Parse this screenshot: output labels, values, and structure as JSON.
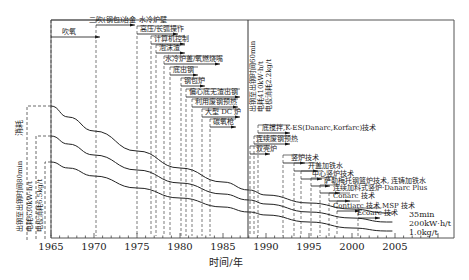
{
  "chart_data": {
    "type": "line",
    "title": "",
    "xlabel": "时间/年",
    "ylabel": "消耗",
    "xlim": [
      1965,
      2010
    ],
    "x_ticks": [
      1965,
      1970,
      1975,
      1980,
      1985,
      1990,
      1995,
      2000,
      2005
    ],
    "grid": false,
    "divider_year": 1988,
    "series": [
      {
        "name": "出钢至出钢时间",
        "start_label": "出钢至出钢时间80min",
        "mid_label": "出钢至出钢时间60min",
        "end_label": "35min",
        "x": [
          1965,
          1967,
          1970,
          1975,
          1980,
          1985,
          1988,
          1990,
          1995,
          2000,
          2004
        ],
        "y_px": [
          106,
          117,
          131,
          151,
          168,
          182,
          190,
          195,
          203,
          209,
          213
        ]
      },
      {
        "name": "电耗",
        "start_label": "电耗630kW·h/t",
        "mid_label": "电耗410kW·h/t",
        "end_label": "200kW·h/t",
        "x": [
          1965,
          1967,
          1970,
          1975,
          1980,
          1985,
          1988,
          1990,
          1995,
          2000,
          2004
        ],
        "y_px": [
          136,
          144,
          155,
          170,
          183,
          194,
          200,
          204,
          212,
          218,
          222
        ]
      },
      {
        "name": "电极消耗",
        "start_label": "电极消耗6.5kg/t",
        "mid_label": "电极消耗2.2kg/t",
        "end_label": "1.0kg/t",
        "x": [
          1965,
          1967,
          1970,
          1975,
          1980,
          1985,
          1988,
          1990,
          1995,
          2000,
          2004
        ],
        "y_px": [
          162,
          168,
          176,
          188,
          198,
          207,
          212,
          215,
          222,
          228,
          231
        ]
      }
    ],
    "technologies": [
      {
        "label": "吹氧",
        "year": 1965
      },
      {
        "label": "二吹(钢包)冶金 水冷炉壁",
        "year": 1970
      },
      {
        "label": "高压/长弧操作",
        "year": 1975
      },
      {
        "label": "计算机控制",
        "year": 1976.5
      },
      {
        "label": "泡沫渣",
        "year": 1977
      },
      {
        "label": "水冷炉盖/氧燃烧嘴",
        "year": 1978
      },
      {
        "label": "底出钢",
        "year": 1979
      },
      {
        "label": "钢包炉",
        "year": 1980.5
      },
      {
        "label": "偏心底无渣出钢",
        "year": 1981
      },
      {
        "label": "利用废钢预热",
        "year": 1982
      },
      {
        "label": "大型 DC 炉",
        "year": 1983.5
      },
      {
        "label": "碳氧枪",
        "year": 1984.5
      },
      {
        "label": "底搅拌,K-ES(Danarc,Korfarc)技术",
        "year": 1987
      },
      {
        "label": "连续废钢预热",
        "year": 1988
      },
      {
        "label": "双壳炉",
        "year": 1988.5
      },
      {
        "label": "竖炉技术",
        "year": 1990
      },
      {
        "label": "开盖加铁水",
        "year": 1992
      },
      {
        "label": "中心竖炉技术",
        "year": 1993
      },
      {
        "label": "萨勒梅托钢篮炉技术, 连铸加铁水",
        "year": 1994
      },
      {
        "label": "连续加料式竖炉·Danarc Plus",
        "year": 1996
      },
      {
        "label": "Conarc 技术",
        "year": 1997
      },
      {
        "label": "Contiarc 技术,MSP 技术",
        "year": 1998
      },
      {
        "label": "Ecoarc 技术",
        "year": 2000.5
      }
    ]
  },
  "labels": {
    "consumption": "消耗",
    "xaxis_title": "时间/年",
    "left": {
      "tap_time": "出钢至出钢时间80min",
      "power": "电耗630kW·h/t",
      "electrode": "电极消耗6.5kg/t"
    },
    "mid": {
      "tap_time": "出钢至出钢时间60min",
      "power": "电耗410kW·h/t",
      "electrode": "电极消耗2.2kg/t"
    },
    "right": {
      "tap_time": "35min",
      "power": "200kW·h/t",
      "electrode": "1.0kg/t"
    },
    "ticks": [
      "1965",
      "1970",
      "1975",
      "1980",
      "1985",
      "1990",
      "1995",
      "2000",
      "2005"
    ],
    "tech": [
      "吹氧",
      "二吹(钢包)冶金 水冷炉壁",
      "高压/长弧操作",
      "计算机控制",
      "泡沫渣",
      "水冷炉盖/氧燃烧嘴",
      "底出钢",
      "钢包炉",
      "偏心底无渣出钢",
      "利用废钢预热",
      "大型 DC 炉",
      "碳氧枪",
      "底搅拌,K-ES(Danarc,Korfarc)技术",
      "连续废钢预热",
      "双壳炉",
      "竖炉技术",
      "开盖加铁水",
      "中心竖炉技术",
      "萨勒梅托钢篮炉技术, 连铸加铁水",
      "连续加料式竖炉·Danarc Plus",
      "Conarc 技术",
      "Contiarc 技术,MSP 技术",
      "Ecoarc 技术"
    ]
  }
}
